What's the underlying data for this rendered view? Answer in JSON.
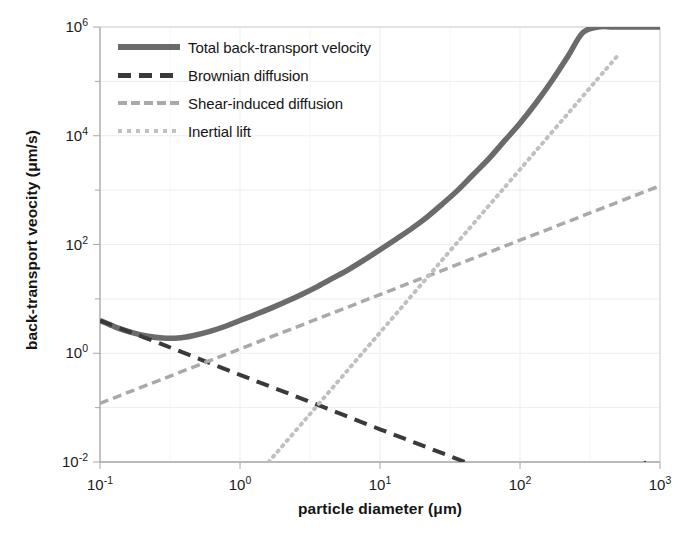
{
  "chart_data": {
    "type": "line",
    "title": "",
    "xlabel": "particle diameter (μm)",
    "ylabel": "back-transport veocity (μm/s)",
    "xscale": "log",
    "yscale": "log",
    "xlim": [
      0.1,
      1000
    ],
    "ylim": [
      0.01,
      1000000
    ],
    "grid": true,
    "legend_position": "top-left-inside",
    "xticks": [
      {
        "value": 0.1,
        "label": "10",
        "exp": "-1"
      },
      {
        "value": 1,
        "label": "10",
        "exp": "0"
      },
      {
        "value": 10,
        "label": "10",
        "exp": "1"
      },
      {
        "value": 100,
        "label": "10",
        "exp": "2"
      },
      {
        "value": 1000,
        "label": "10",
        "exp": "3"
      }
    ],
    "yticks": [
      {
        "value": 1000000,
        "label": "10",
        "exp": "6"
      },
      {
        "value": 10000,
        "label": "10",
        "exp": "4"
      },
      {
        "value": 100,
        "label": "10",
        "exp": "2"
      },
      {
        "value": 1,
        "label": "10",
        "exp": "0"
      },
      {
        "value": 0.01,
        "label": "10",
        "exp": "-2"
      }
    ],
    "series": [
      {
        "name": "Total back-transport velocity",
        "style": "solid",
        "color": "#6b6b6b",
        "width": 5.5,
        "x": [
          0.1,
          0.13,
          0.17,
          0.22,
          0.28,
          0.36,
          0.46,
          0.6,
          0.78,
          1.0,
          1.3,
          1.7,
          2.2,
          2.8,
          3.6,
          4.6,
          6.0,
          7.8,
          10,
          13,
          17,
          22,
          28,
          36,
          46,
          60,
          78,
          100,
          130,
          170,
          220,
          280,
          360,
          460,
          600,
          780,
          1000
        ],
        "y": [
          4.0,
          3.0,
          2.4,
          2.05,
          1.9,
          1.9,
          2.1,
          2.5,
          3.1,
          4.0,
          5.2,
          6.9,
          9.2,
          12.3,
          17.0,
          24.0,
          35.0,
          53.0,
          80.0,
          125,
          200,
          330,
          560,
          1000,
          1900,
          3800,
          8200,
          17000,
          40000,
          105000,
          290000,
          780000,
          1000000,
          1000000,
          1000000,
          1000000,
          1000000
        ]
      },
      {
        "name": "Brownian diffusion",
        "style": "dashed",
        "color": "#3a3a3a",
        "width": 4,
        "x": [
          0.1,
          0.3,
          1.0,
          3.0,
          10,
          30,
          100,
          300,
          800
        ],
        "y": [
          4.0,
          1.35,
          0.4,
          0.135,
          0.04,
          0.0135,
          0.004,
          0.00135,
          0.01
        ]
      },
      {
        "name": "Shear-induced diffusion",
        "style": "dashed",
        "color": "#a9a9a9",
        "width": 3.5,
        "x": [
          0.1,
          1.0,
          10,
          100,
          1000
        ],
        "y": [
          0.12,
          1.2,
          12,
          120,
          1200
        ]
      },
      {
        "name": "Inertial lift",
        "style": "dotted",
        "color": "#c0c0c0",
        "width": 4,
        "x": [
          1.6,
          3.0,
          6.0,
          10,
          30,
          60,
          100,
          300,
          500
        ],
        "y": [
          0.01,
          0.065,
          0.52,
          2.4,
          65,
          520,
          2400,
          65000,
          300000
        ]
      }
    ],
    "notes": {
      "crossover_brownian_shear": "~0.45 μm",
      "minimum_total_velocity": "~2 μm/s at ~0.35 μm",
      "crossover_shear_inertial": "~60 μm"
    }
  },
  "axes": {
    "ylabel": "back-transport veocity (μm/s)",
    "xlabel": "particle diameter (μm)"
  },
  "legend": {
    "items": [
      {
        "label": "Total back-transport velocity",
        "key": "solid-line-key"
      },
      {
        "label": "Brownian diffusion",
        "key": "dashed-dark-line-key"
      },
      {
        "label": "Shear-induced diffusion",
        "key": "dashed-light-line-key"
      },
      {
        "label": "Inertial lift",
        "key": "dotted-light-line-key"
      }
    ]
  },
  "colors": {
    "total": "#6b6b6b",
    "brownian": "#3a3a3a",
    "shear": "#a9a9a9",
    "inertial": "#c0c0c0",
    "axis": "#a6a6a6",
    "grid": "#ededed",
    "text": "#161616"
  }
}
